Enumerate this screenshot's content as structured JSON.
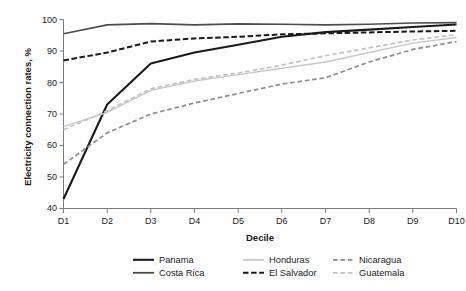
{
  "chart_data": {
    "type": "line",
    "title": "",
    "xlabel": "Decile",
    "ylabel": "Electricity connection rates, %",
    "categories": [
      "D1",
      "D2",
      "D3",
      "D4",
      "D5",
      "D6",
      "D7",
      "D8",
      "D9",
      "D10"
    ],
    "xlim": [
      0,
      9
    ],
    "ylim": [
      40,
      100
    ],
    "yticks": [
      40,
      50,
      60,
      70,
      80,
      90,
      100
    ],
    "grid": false,
    "legend_position": "bottom",
    "series": [
      {
        "name": "Panama",
        "style": "solid",
        "color": "#1a1a1a",
        "width": 2.1,
        "values": [
          43.0,
          73.0,
          86.0,
          89.5,
          92.0,
          94.5,
          96.0,
          96.8,
          97.6,
          98.4
        ]
      },
      {
        "name": "Honduras",
        "style": "solid",
        "color": "#c8c8c8",
        "width": 1.5,
        "values": [
          66.0,
          70.5,
          77.5,
          80.5,
          82.5,
          84.5,
          86.5,
          89.5,
          92.5,
          94.3
        ]
      },
      {
        "name": "Nicaragua",
        "style": "dashed",
        "color": "#8c8c8c",
        "width": 1.7,
        "values": [
          54.0,
          64.0,
          70.0,
          73.5,
          76.5,
          79.5,
          81.5,
          86.5,
          90.5,
          93.0
        ]
      },
      {
        "name": "Costa Rica",
        "style": "solid",
        "color": "#4d4d4d",
        "width": 1.6,
        "values": [
          95.5,
          98.3,
          98.7,
          98.3,
          98.6,
          98.5,
          98.3,
          98.5,
          98.9,
          99.0
        ]
      },
      {
        "name": "El Salvador",
        "style": "dashed",
        "color": "#1a1a1a",
        "width": 2.0,
        "values": [
          87.0,
          89.5,
          93.0,
          94.0,
          94.5,
          95.3,
          95.6,
          95.9,
          96.2,
          96.4
        ]
      },
      {
        "name": "Guatemala",
        "style": "dashed",
        "color": "#c2c2c2",
        "width": 1.7,
        "values": [
          65.0,
          71.0,
          78.0,
          81.0,
          83.0,
          85.5,
          88.5,
          91.0,
          93.5,
          95.2
        ]
      }
    ]
  },
  "axes": {
    "y_title": "Electricity connection rates, %",
    "x_title": "Decile",
    "y_tick_labels": [
      "100",
      "90",
      "80",
      "70",
      "60",
      "50",
      "40"
    ],
    "x_tick_labels": [
      "D1",
      "D2",
      "D3",
      "D4",
      "D5",
      "D6",
      "D7",
      "D8",
      "D9",
      "D10"
    ]
  },
  "legend": {
    "row1": [
      {
        "label": "Panama",
        "swatch": "solid-black-thick"
      },
      {
        "label": "Honduras",
        "swatch": "solid-lightgray"
      },
      {
        "label": "Nicaragua",
        "swatch": "dashed-darkgray"
      }
    ],
    "row2": [
      {
        "label": "Costa Rica",
        "swatch": "solid-darkgray"
      },
      {
        "label": "El Salvador",
        "swatch": "dashed-black-thick"
      },
      {
        "label": "Guatemala",
        "swatch": "dashed-lightgray"
      }
    ]
  }
}
